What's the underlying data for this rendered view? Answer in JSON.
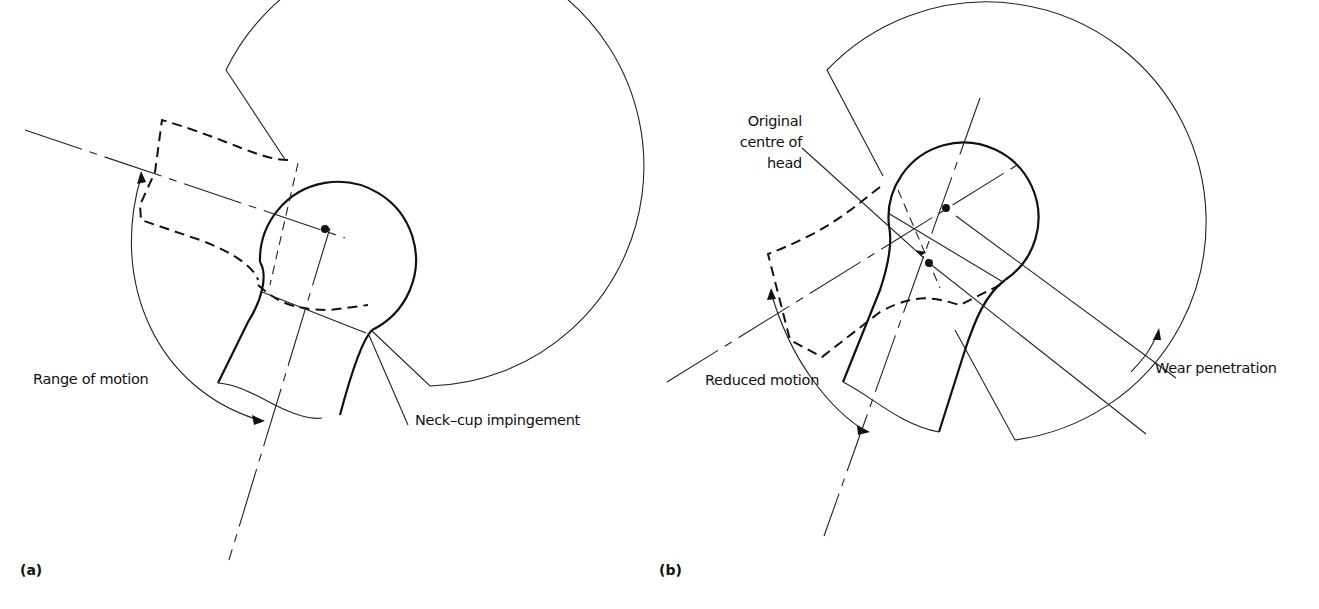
{
  "figure": {
    "panels": [
      {
        "tag": "(a)",
        "labels": {
          "range_of_motion": "Range of motion",
          "impingement": "Neck–cup impingement"
        }
      },
      {
        "tag": "(b)",
        "labels": {
          "original_centre_line1": "Original",
          "original_centre_line2": "centre of",
          "original_centre_line3": "head",
          "reduced_motion": "Reduced motion",
          "wear_penetration": "Wear penetration"
        }
      }
    ]
  }
}
